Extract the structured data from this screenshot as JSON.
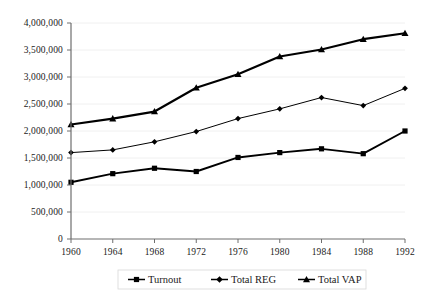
{
  "chart_data": {
    "type": "line",
    "title": "",
    "subtitle": "",
    "xlabel": "",
    "ylabel": "",
    "x": [
      1960,
      1964,
      1968,
      1972,
      1976,
      1980,
      1984,
      1988,
      1992
    ],
    "categories": [
      "1960",
      "1964",
      "1968",
      "1972",
      "1976",
      "1980",
      "1984",
      "1988",
      "1992"
    ],
    "xtick_labels": [
      "1960",
      "1964",
      "1968",
      "1972",
      "1976",
      "1980",
      "1984",
      "1988",
      "1992"
    ],
    "ytick_labels": [
      "0",
      "500,000",
      "1,000,000",
      "1,500,000",
      "2,000,000",
      "2,500,000",
      "3,000,000",
      "3,500,000",
      "4,000,000"
    ],
    "ytick_values": [
      0,
      500000,
      1000000,
      1500000,
      2000000,
      2500000,
      3000000,
      3500000,
      4000000
    ],
    "ylim": [
      0,
      4000000
    ],
    "xlim": [
      1960,
      1992
    ],
    "grid": true,
    "legend_position": "bottom",
    "series": [
      {
        "name": "Turnout",
        "marker": "square",
        "color": "#000000",
        "values": [
          1050000,
          1210000,
          1310000,
          1250000,
          1510000,
          1600000,
          1670000,
          1580000,
          2000000
        ]
      },
      {
        "name": "Total REG",
        "marker": "diamond",
        "color": "#000000",
        "values": [
          1600000,
          1650000,
          1800000,
          1990000,
          2230000,
          2410000,
          2620000,
          2470000,
          2790000
        ]
      },
      {
        "name": "Total VAP",
        "marker": "triangle",
        "color": "#000000",
        "values": [
          2120000,
          2230000,
          2360000,
          2800000,
          3050000,
          3380000,
          3510000,
          3700000,
          3810000
        ]
      }
    ]
  },
  "legend": {
    "items": [
      {
        "label": "Turnout",
        "marker": "square"
      },
      {
        "label": "Total REG",
        "marker": "diamond"
      },
      {
        "label": "Total VAP",
        "marker": "triangle"
      }
    ]
  },
  "colors": {
    "background": "#ffffff",
    "axis": "#6e6e6e",
    "grid": "#f0f0f0",
    "ink": "#000000"
  }
}
